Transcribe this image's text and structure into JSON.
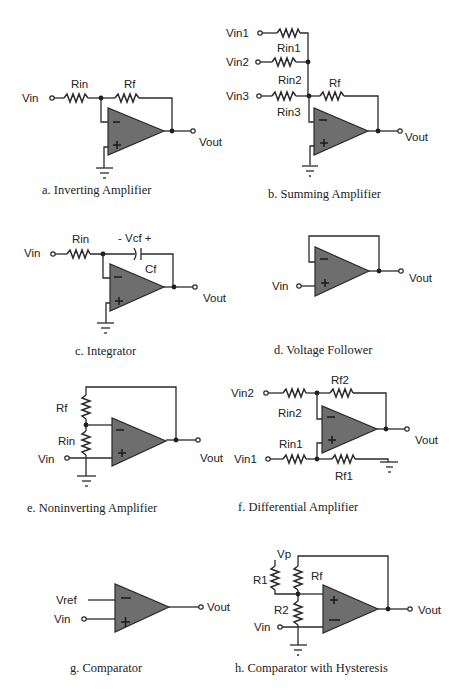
{
  "figure": {
    "colors": {
      "background": "#ffffff",
      "opamp_fill": "#6e6e6e",
      "wire": "#2a2a2a"
    },
    "panels": [
      {
        "id": "a",
        "caption": "a. Inverting Amplifier",
        "labels": {
          "vin": "Vin",
          "rin": "Rin",
          "rf": "Rf",
          "vout": "Vout"
        },
        "components": [
          "Rin",
          "Rf",
          "op-amp",
          "ground"
        ]
      },
      {
        "id": "b",
        "caption": "b. Summing Amplifier",
        "labels": {
          "vin1": "Vin1",
          "vin2": "Vin2",
          "vin3": "Vin3",
          "rin1": "Rin1",
          "rin2": "Rin2",
          "rin3": "Rin3",
          "rf": "Rf",
          "vout": "Vout"
        },
        "components": [
          "Rin1",
          "Rin2",
          "Rin3",
          "Rf",
          "op-amp",
          "ground"
        ]
      },
      {
        "id": "c",
        "caption": "c. Integrator",
        "labels": {
          "vin": "Vin",
          "rin": "Rin",
          "vcf": "- Vcf +",
          "cf": "Cf",
          "vout": "Vout"
        },
        "components": [
          "Rin",
          "Cf",
          "op-amp",
          "ground"
        ]
      },
      {
        "id": "d",
        "caption": "d. Voltage Follower",
        "labels": {
          "vin": "Vin",
          "vout": "Vout"
        },
        "components": [
          "op-amp"
        ]
      },
      {
        "id": "e",
        "caption": "e. Noninverting Amplifier",
        "labels": {
          "rf": "Rf",
          "rin": "Rin",
          "vin": "Vin",
          "vout": "Vout"
        },
        "components": [
          "Rf",
          "Rin",
          "op-amp",
          "ground"
        ]
      },
      {
        "id": "f",
        "caption": "f. Differential Amplifier",
        "labels": {
          "vin2": "Vin2",
          "rin2": "Rin2",
          "rf2": "Rf2",
          "vin1": "Vin1",
          "rin1": "Rin1",
          "rf1": "Rf1",
          "vout": "Vout"
        },
        "components": [
          "Rin2",
          "Rf2",
          "Rin1",
          "Rf1",
          "op-amp",
          "ground"
        ]
      },
      {
        "id": "g",
        "caption": "g. Comparator",
        "labels": {
          "vref": "Vref",
          "vin": "Vin",
          "vout": "Vout"
        },
        "components": [
          "op-amp"
        ]
      },
      {
        "id": "h",
        "caption": "h. Comparator with Hysteresis",
        "labels": {
          "vp": "Vp",
          "r1": "R1",
          "rf": "Rf",
          "r2": "R2",
          "vin": "Vin",
          "vout": "Vout"
        },
        "components": [
          "R1",
          "Rf",
          "R2",
          "op-amp",
          "ground"
        ]
      }
    ],
    "symbols": {
      "minus": "−",
      "plus": "+"
    }
  }
}
